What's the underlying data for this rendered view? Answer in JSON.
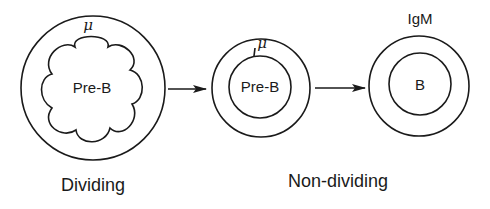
{
  "diagram": {
    "type": "cell-differentiation-flow",
    "cells": [
      {
        "id": "dividing-pre-b",
        "nucleus_label": "Pre-B",
        "marker_label": "μ",
        "nucleus_shape": "cloud"
      },
      {
        "id": "nondividing-pre-b",
        "nucleus_label": "Pre-B",
        "marker_label": "μ",
        "nucleus_shape": "circle"
      },
      {
        "id": "b-cell",
        "nucleus_label": "B",
        "marker_label": "IgM",
        "nucleus_shape": "circle"
      }
    ],
    "arrows": [
      {
        "from": "dividing-pre-b",
        "to": "nondividing-pre-b"
      },
      {
        "from": "nondividing-pre-b",
        "to": "b-cell"
      }
    ],
    "stage_labels": {
      "dividing": "Dividing",
      "non_dividing": "Non-dividing"
    }
  }
}
